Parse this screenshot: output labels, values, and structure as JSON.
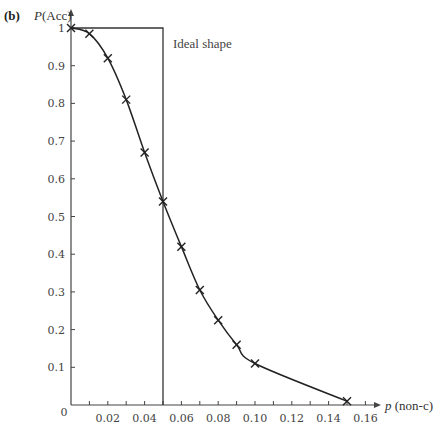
{
  "panel_label": "(b)",
  "y_axis_title": {
    "italic": "P",
    "rest": "(Acc)"
  },
  "x_axis_title": {
    "italic": "p",
    "rest": " (non-c)"
  },
  "annotation": "Ideal shape",
  "origin_label": "0",
  "colors": {
    "axis": "#444444",
    "curve": "#222222",
    "ideal": "#333333",
    "text": "#444444"
  },
  "chart_data": {
    "type": "line",
    "title": "",
    "panel": "(b)",
    "xlabel": "p (non-c)",
    "ylabel": "P(Acc)",
    "xlim": [
      0,
      0.165
    ],
    "ylim": [
      0,
      1.0
    ],
    "grid": false,
    "legend": null,
    "x_ticks": [
      0.01,
      0.02,
      0.03,
      0.04,
      0.05,
      0.06,
      0.07,
      0.08,
      0.09,
      0.1,
      0.11,
      0.12,
      0.13,
      0.14,
      0.15,
      0.16
    ],
    "x_tick_labels": [
      "0.02",
      "0.04",
      "0.06",
      "0.08",
      "0.10",
      "0.12",
      "0.14",
      "0.16"
    ],
    "x_tick_label_values": [
      0.02,
      0.04,
      0.06,
      0.08,
      0.1,
      0.12,
      0.14,
      0.16
    ],
    "y_ticks": [
      0.1,
      0.2,
      0.3,
      0.4,
      0.5,
      0.6,
      0.7,
      0.8,
      0.9,
      1.0
    ],
    "y_tick_labels": [
      "0.1",
      "0.2",
      "0.3",
      "0.4",
      "0.5",
      "0.6",
      "0.7",
      "0.8",
      "0.9",
      "1"
    ],
    "series": [
      {
        "name": "OC curve",
        "marker": "x",
        "smooth": true,
        "x": [
          0.0,
          0.01,
          0.02,
          0.03,
          0.04,
          0.05,
          0.06,
          0.07,
          0.08,
          0.09,
          0.1,
          0.15
        ],
        "y": [
          1.0,
          0.985,
          0.92,
          0.81,
          0.67,
          0.54,
          0.42,
          0.305,
          0.225,
          0.16,
          0.11,
          0.01
        ]
      },
      {
        "name": "Ideal shape",
        "marker": "none",
        "step": true,
        "x": [
          0.0,
          0.05,
          0.05
        ],
        "y": [
          1.0,
          1.0,
          0.0
        ]
      }
    ],
    "annotations": [
      {
        "text": "Ideal shape",
        "x": 0.052,
        "y": 0.97
      }
    ]
  }
}
